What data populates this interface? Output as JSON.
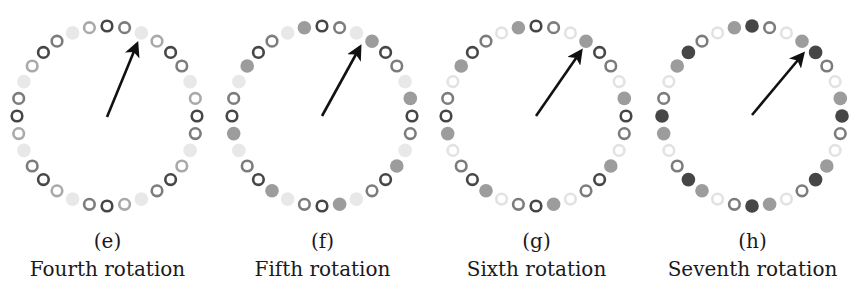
{
  "marker_styles": {
    "dark_ring": {
      "kind": "ring",
      "color": "#464646"
    },
    "mid_ring": {
      "kind": "ring",
      "color": "#7c7c7c"
    },
    "light_ring": {
      "kind": "ring",
      "color": "#a9a9a9"
    },
    "faint_ring": {
      "kind": "ring",
      "color": "#e2e2e2"
    },
    "light_fill": {
      "kind": "fill",
      "color": "#e8e8e8"
    },
    "mid_fill": {
      "kind": "fill",
      "color": "#9c9c9c"
    },
    "dark_fill": {
      "kind": "fill",
      "color": "#464646"
    }
  },
  "ring_layout": {
    "positions": 32,
    "radius": 90,
    "marker_radius": 6.5,
    "start_angle_deg": 0,
    "direction": "clockwise"
  },
  "panels": [
    {
      "id": "e",
      "sublabel": "(e)",
      "caption": "Fourth rotation",
      "center": [
        107,
        116
      ],
      "pattern": [
        "dark_ring",
        "mid_ring",
        "light_fill",
        "light_ring"
      ],
      "arrow": {
        "from": [
          107,
          117
        ],
        "to": [
          137,
          44
        ]
      }
    },
    {
      "id": "f",
      "sublabel": "(f)",
      "caption": "Fifth rotation",
      "center": [
        322,
        116
      ],
      "pattern": [
        "dark_ring",
        "mid_ring",
        "light_fill",
        "mid_fill"
      ],
      "arrow": {
        "from": [
          322,
          116
        ],
        "to": [
          360,
          47
        ]
      }
    },
    {
      "id": "g",
      "sublabel": "(g)",
      "caption": "Sixth rotation",
      "center": [
        536,
        116
      ],
      "pattern": [
        "dark_ring",
        "mid_ring",
        "faint_ring",
        "mid_fill"
      ],
      "arrow": {
        "from": [
          536,
          116
        ],
        "to": [
          581,
          51
        ]
      }
    },
    {
      "id": "h",
      "sublabel": "(h)",
      "caption": "Seventh rotation",
      "center": [
        752,
        116
      ],
      "pattern": [
        "dark_fill",
        "mid_ring",
        "faint_ring",
        "mid_fill"
      ],
      "arrow": {
        "from": [
          752,
          115
        ],
        "to": [
          803,
          54
        ]
      }
    }
  ]
}
